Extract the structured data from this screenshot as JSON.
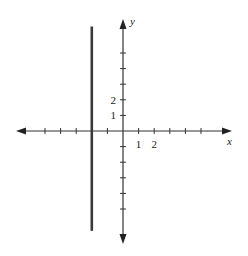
{
  "chart_data": {
    "type": "line",
    "title": "",
    "xlabel": "x",
    "ylabel": "y",
    "xlim": [
      -6,
      7
    ],
    "ylim": [
      -7,
      7
    ],
    "x_ticks": [
      -5,
      -4,
      -3,
      -2,
      -1,
      1,
      2,
      3,
      4,
      5
    ],
    "y_ticks": [
      -5,
      -4,
      -3,
      -2,
      -1,
      1,
      2,
      3,
      4,
      5
    ],
    "x_tick_labels": [
      {
        "value": 1,
        "text": "1"
      },
      {
        "value": 2,
        "text": "2"
      }
    ],
    "y_tick_labels": [
      {
        "value": 1,
        "text": "1"
      },
      {
        "value": 2,
        "text": "2"
      }
    ],
    "grid": false,
    "legend": "none",
    "series": [
      {
        "name": "x = -2",
        "kind": "vertical-line",
        "x": -2,
        "y_range": [
          -6.4,
          6.7
        ],
        "color": "#3a3a3a"
      }
    ]
  }
}
